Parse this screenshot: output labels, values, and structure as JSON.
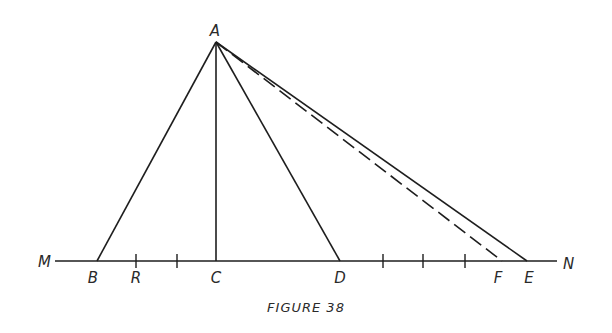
{
  "figure": {
    "caption": "FIGURE 38",
    "stroke_color": "#1e1e1e",
    "apex": {
      "label": "A",
      "x": 216,
      "y": 42
    },
    "baseline": {
      "y": 261,
      "x_start": 55,
      "x_end": 557,
      "left_label": "M",
      "right_label": "N"
    },
    "points": [
      {
        "label": "B",
        "x": 97
      },
      {
        "label": "R",
        "x": 136
      },
      {
        "label": "C",
        "x": 216
      },
      {
        "label": "D",
        "x": 340
      },
      {
        "label": "F",
        "x": 502
      },
      {
        "label": "E",
        "x": 527
      }
    ],
    "tick_marks_x": [
      136,
      177,
      383,
      423,
      465
    ],
    "segments": [
      {
        "from": "A",
        "to": "B",
        "style": "solid"
      },
      {
        "from": "A",
        "to": "C",
        "style": "solid"
      },
      {
        "from": "A",
        "to": "D",
        "style": "solid"
      },
      {
        "from": "A",
        "to": "F",
        "style": "dashed"
      },
      {
        "from": "A",
        "to": "E",
        "style": "solid"
      }
    ]
  }
}
